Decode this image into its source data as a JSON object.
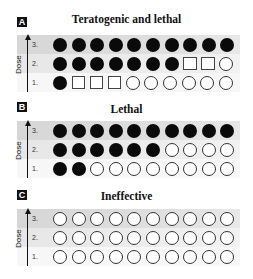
{
  "axis_title": "Dose",
  "dose_levels": [
    "3.",
    "2.",
    "1."
  ],
  "legend_note": "filled-circle = affected/dead, open-square = malformed, open-circle = unaffected",
  "panels": [
    {
      "letter": "A",
      "title": "Teratogenic and lethal",
      "rows": [
        {
          "dose": "3.",
          "marks": [
            "filled-circle",
            "filled-circle",
            "filled-circle",
            "filled-circle",
            "filled-circle",
            "filled-circle",
            "filled-circle",
            "filled-circle",
            "filled-circle",
            "filled-circle"
          ]
        },
        {
          "dose": "2.",
          "marks": [
            "filled-circle",
            "filled-circle",
            "filled-circle",
            "filled-circle",
            "filled-circle",
            "filled-circle",
            "filled-circle",
            "open-square",
            "open-square",
            "open-circle"
          ]
        },
        {
          "dose": "1.",
          "marks": [
            "filled-circle",
            "open-square",
            "open-square",
            "open-square",
            "open-circle",
            "open-circle",
            "open-circle",
            "open-circle",
            "open-circle",
            "open-circle"
          ]
        }
      ]
    },
    {
      "letter": "B",
      "title": "Lethal",
      "rows": [
        {
          "dose": "3.",
          "marks": [
            "filled-circle",
            "filled-circle",
            "filled-circle",
            "filled-circle",
            "filled-circle",
            "filled-circle",
            "filled-circle",
            "filled-circle",
            "filled-circle",
            "filled-circle"
          ]
        },
        {
          "dose": "2.",
          "marks": [
            "filled-circle",
            "filled-circle",
            "filled-circle",
            "filled-circle",
            "filled-circle",
            "filled-circle",
            "open-circle",
            "open-circle",
            "open-circle",
            "open-circle"
          ]
        },
        {
          "dose": "1.",
          "marks": [
            "filled-circle",
            "filled-circle",
            "open-circle",
            "open-circle",
            "open-circle",
            "open-circle",
            "open-circle",
            "open-circle",
            "open-circle",
            "open-circle"
          ]
        }
      ]
    },
    {
      "letter": "C",
      "title": "Ineffective",
      "rows": [
        {
          "dose": "3.",
          "marks": [
            "open-circle",
            "open-circle",
            "open-circle",
            "open-circle",
            "open-circle",
            "open-circle",
            "open-circle",
            "open-circle",
            "open-circle",
            "open-circle"
          ]
        },
        {
          "dose": "2.",
          "marks": [
            "open-circle",
            "open-circle",
            "open-circle",
            "open-circle",
            "open-circle",
            "open-circle",
            "open-circle",
            "open-circle",
            "open-circle",
            "open-circle"
          ]
        },
        {
          "dose": "1.",
          "marks": [
            "open-circle",
            "open-circle",
            "open-circle",
            "open-circle",
            "open-circle",
            "open-circle",
            "open-circle",
            "open-circle",
            "open-circle",
            "open-circle"
          ]
        }
      ]
    }
  ]
}
